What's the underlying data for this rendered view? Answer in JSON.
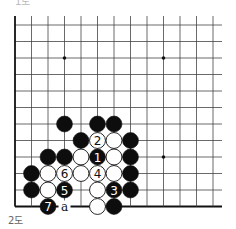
{
  "diagram": {
    "caption": "2도",
    "top_fragment": "1도",
    "board": {
      "origin_x": 15,
      "origin_y": 25,
      "spacing": 16.5,
      "cols": 13,
      "rows": 12,
      "right_extent": 222,
      "top_extent": 16,
      "left_edge": true,
      "bottom_edge": true,
      "line_color": "#444444",
      "edge_color": "#111111"
    },
    "star_points": [
      {
        "col": 3,
        "row": 2
      },
      {
        "col": 9,
        "row": 2
      },
      {
        "col": 9,
        "row": 8
      }
    ],
    "stones": [
      {
        "color": "black",
        "col": 3,
        "row": 6,
        "label": ""
      },
      {
        "color": "black",
        "col": 5,
        "row": 6,
        "label": ""
      },
      {
        "color": "black",
        "col": 6,
        "row": 6,
        "label": ""
      },
      {
        "color": "black",
        "col": 4,
        "row": 7,
        "label": ""
      },
      {
        "color": "white",
        "col": 5,
        "row": 7,
        "label": "2"
      },
      {
        "color": "white",
        "col": 6,
        "row": 7,
        "label": ""
      },
      {
        "color": "black",
        "col": 7,
        "row": 7,
        "label": ""
      },
      {
        "color": "black",
        "col": 2,
        "row": 8,
        "label": ""
      },
      {
        "color": "black",
        "col": 3,
        "row": 8,
        "label": ""
      },
      {
        "color": "white",
        "col": 4,
        "row": 8,
        "label": ""
      },
      {
        "color": "black",
        "col": 5,
        "row": 8,
        "label": "1"
      },
      {
        "color": "white",
        "col": 6,
        "row": 8,
        "label": ""
      },
      {
        "color": "black",
        "col": 7,
        "row": 8,
        "label": ""
      },
      {
        "color": "black",
        "col": 1,
        "row": 9,
        "label": ""
      },
      {
        "color": "white",
        "col": 2,
        "row": 9,
        "label": ""
      },
      {
        "color": "white",
        "col": 3,
        "row": 9,
        "label": "6"
      },
      {
        "color": "white",
        "col": 4,
        "row": 9,
        "label": ""
      },
      {
        "color": "white",
        "col": 5,
        "row": 9,
        "label": "4"
      },
      {
        "color": "white",
        "col": 6,
        "row": 9,
        "label": ""
      },
      {
        "color": "black",
        "col": 7,
        "row": 9,
        "label": ""
      },
      {
        "color": "black",
        "col": 1,
        "row": 10,
        "label": ""
      },
      {
        "color": "white",
        "col": 2,
        "row": 10,
        "label": ""
      },
      {
        "color": "black",
        "col": 3,
        "row": 10,
        "label": "5"
      },
      {
        "color": "white",
        "col": 5,
        "row": 10,
        "label": ""
      },
      {
        "color": "black",
        "col": 6,
        "row": 10,
        "label": "3"
      },
      {
        "color": "black",
        "col": 7,
        "row": 10,
        "label": ""
      },
      {
        "color": "black",
        "col": 2,
        "row": 11,
        "label": "7"
      },
      {
        "color": "white",
        "col": 5,
        "row": 11,
        "label": ""
      },
      {
        "color": "black",
        "col": 6,
        "row": 11,
        "label": ""
      }
    ],
    "markers": [
      {
        "col": 3,
        "row": 11,
        "label": "a"
      }
    ]
  }
}
